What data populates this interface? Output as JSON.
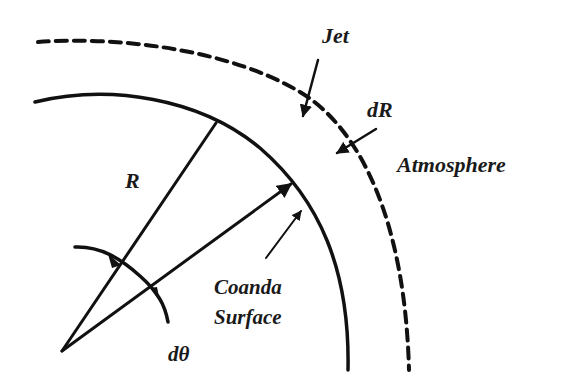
{
  "diagram": {
    "type": "coanda-surface-schematic",
    "colors": {
      "line": "#111111",
      "text": "#1a1a1a",
      "background": "#ffffff"
    },
    "labels": {
      "jet": "Jet",
      "dR": "dR",
      "atmosphere": "Atmosphere",
      "R": "R",
      "coanda_line1": "Coanda",
      "coanda_line2": "Surface",
      "dtheta": "dθ"
    },
    "elements": {
      "coanda_surface": "solid arc (radius R)",
      "jet_boundary": "dashed arc (radius R + dR)",
      "radius_lines": [
        "R",
        "R at angle dθ"
      ],
      "angle_arc": "dθ"
    }
  }
}
